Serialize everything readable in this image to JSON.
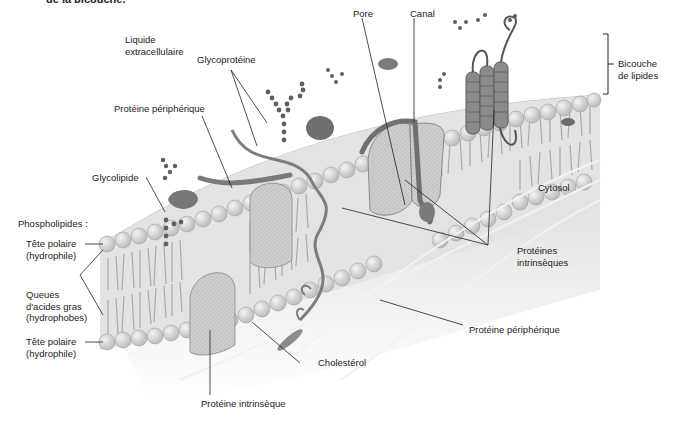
{
  "caption": "de la bicouche.",
  "labels": {
    "liquide_extracellulaire": [
      "Liquide",
      "extracellulaire"
    ],
    "glycoproteine": "Glycoprotéine",
    "pore": "Pore",
    "canal": "Canal",
    "bicouche": [
      "Bicouche",
      "de lipides"
    ],
    "proteine_peripherique_top": "Protéine périphérique",
    "glycolipide": "Glycolipide",
    "cytosol": "Cytosol",
    "phospholipides": "Phospholipides :",
    "tete_polaire_top": [
      "Tête polaire",
      "(hydrophile)"
    ],
    "queues": [
      "Queues",
      "d'acides gras",
      "(hydrophobes)"
    ],
    "tete_polaire_bottom": [
      "Tête polaire",
      "(hydrophile)"
    ],
    "proteines_intrinseques": [
      "Protéines",
      "intrinsèques"
    ],
    "proteine_peripherique_bottom": "Protéine périphérique",
    "cholesterol": "Cholestérol",
    "proteine_intrinseque": "Protéine intrinsèque"
  },
  "colors": {
    "membrane_surface": "#d9d9d9",
    "lipid_head": "#cfcfcf",
    "protein": "#8a8a8a",
    "protein_dark": "#6e6e6e",
    "cytosol": "#e4e4e4",
    "leader_line": "#222222"
  }
}
